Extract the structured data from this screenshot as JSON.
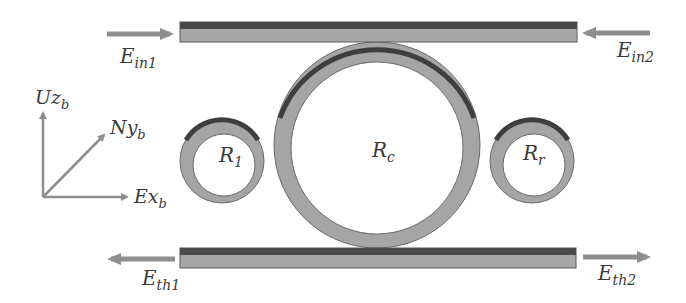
{
  "diagram": {
    "type": "optical microring resonator schematic",
    "colors": {
      "waveguide_fill": "#a8a8a8",
      "waveguide_dark": "#4a4a4a",
      "ring_fill": "#a5a5a5",
      "arrow": "#8e8e8e",
      "text": "#3a3a3a"
    },
    "ports": {
      "in1": {
        "base": "E",
        "sub": "in1"
      },
      "in2": {
        "base": "E",
        "sub": "in2"
      },
      "th1": {
        "base": "E",
        "sub": "th1"
      },
      "th2": {
        "base": "E",
        "sub": "th2"
      }
    },
    "rings": {
      "left": {
        "base": "R",
        "sub": "1"
      },
      "center": {
        "base": "R",
        "sub": "c"
      },
      "right": {
        "base": "R",
        "sub": "r"
      }
    },
    "axes": {
      "z": {
        "base": "Uz",
        "sub": "b"
      },
      "y": {
        "base": "Ny",
        "sub": "b"
      },
      "x": {
        "base": "Ex",
        "sub": "b"
      }
    }
  }
}
